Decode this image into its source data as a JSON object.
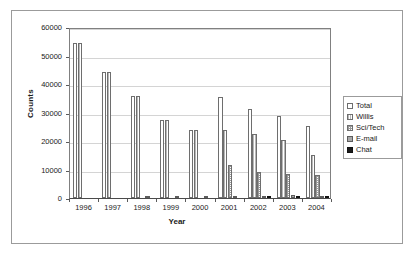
{
  "chart_data": {
    "type": "bar",
    "title": "",
    "xlabel": "Year",
    "ylabel": "Counts",
    "categories": [
      "1996",
      "1997",
      "1998",
      "1999",
      "2000",
      "2001",
      "2002",
      "2003",
      "2004"
    ],
    "ylim": [
      0,
      60000
    ],
    "ytick_labels": [
      "0",
      "10000",
      "20000",
      "30000",
      "40000",
      "50000",
      "60000"
    ],
    "ytick_values": [
      0,
      10000,
      20000,
      30000,
      40000,
      50000,
      60000
    ],
    "grid": true,
    "legend_position": "right",
    "series": [
      {
        "name": "Total",
        "swatch": "white-outline",
        "values": [
          54400,
          44200,
          35700,
          27400,
          24000,
          35400,
          31300,
          28900,
          25200
        ]
      },
      {
        "name": "Willis",
        "swatch": "light-vertical-lines",
        "values": [
          54400,
          44200,
          35700,
          27400,
          24000,
          23800,
          22400,
          20300,
          15200
        ]
      },
      {
        "name": "Sci/Tech",
        "swatch": "dotted-crosshatch",
        "values": [
          0,
          0,
          0,
          0,
          0,
          11500,
          9000,
          8400,
          8000
        ]
      },
      {
        "name": "E-mail",
        "swatch": "gray-solid",
        "values": [
          0,
          0,
          250,
          380,
          330,
          300,
          700,
          900,
          800
        ]
      },
      {
        "name": "Chat",
        "swatch": "black-solid",
        "values": [
          0,
          0,
          0,
          0,
          0,
          0,
          500,
          750,
          800
        ]
      }
    ]
  },
  "legend": {
    "items": [
      {
        "label": "Total"
      },
      {
        "label": "Willis"
      },
      {
        "label": "Sci/Tech"
      },
      {
        "label": "E-mail"
      },
      {
        "label": "Chat"
      }
    ]
  }
}
